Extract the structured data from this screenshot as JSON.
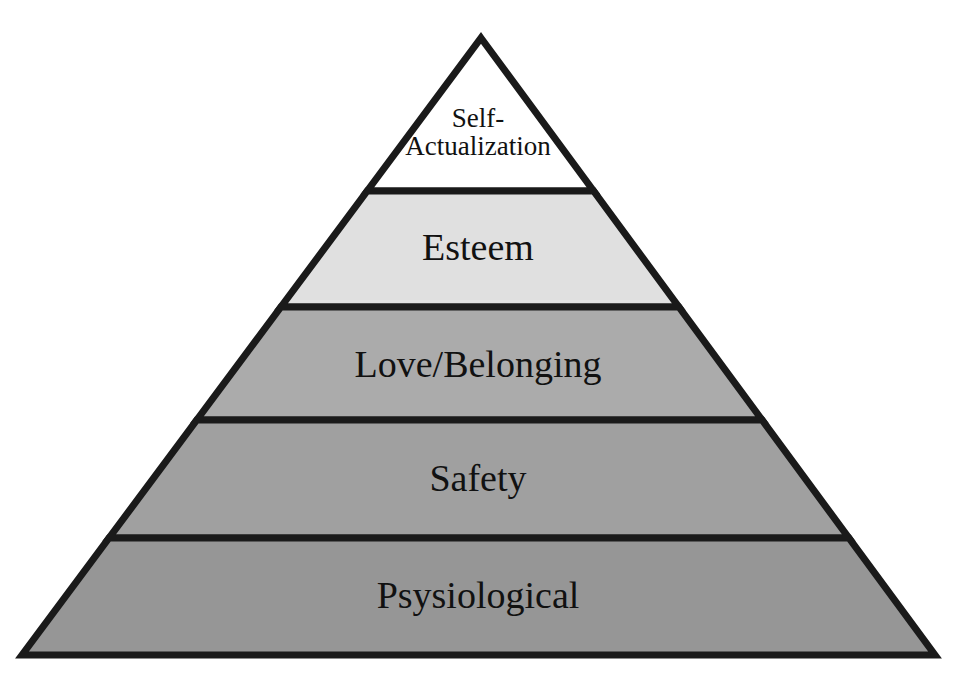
{
  "figure": {
    "name": "maslows-hierarchy-of-needs-pyramid",
    "shape": "pyramid",
    "background_color": "#ffffff",
    "outline_color": "#1a1a1a",
    "outline_width_px": 7,
    "apex": {
      "x": 481,
      "y": 38
    },
    "base_left": {
      "x": 22,
      "y": 655
    },
    "base_right": {
      "x": 935,
      "y": 655
    },
    "divider_y": [
      191,
      307,
      420,
      538
    ]
  },
  "chart_data": {
    "type": "pyramid",
    "title": "",
    "tiers": [
      {
        "label": "Self-\nActualization",
        "label_plain": "Self-Actualization",
        "rank": 5,
        "fill": "#ffffff",
        "top_y": 38,
        "bottom_y": 191,
        "font_size_class": "size-small"
      },
      {
        "label": "Esteem",
        "label_plain": "Esteem",
        "rank": 4,
        "fill": "#e0e0e0",
        "top_y": 191,
        "bottom_y": 307,
        "font_size_class": "size-large"
      },
      {
        "label": "Love/Belonging",
        "label_plain": "Love/Belonging",
        "rank": 3,
        "fill": "#ababab",
        "top_y": 307,
        "bottom_y": 420,
        "font_size_class": "size-large"
      },
      {
        "label": "Safety",
        "label_plain": "Safety",
        "rank": 2,
        "fill": "#a0a0a0",
        "top_y": 420,
        "bottom_y": 538,
        "font_size_class": "size-large"
      },
      {
        "label": "Psysiological",
        "label_plain": "Psysiological",
        "rank": 1,
        "fill": "#969696",
        "top_y": 538,
        "bottom_y": 655,
        "font_size_class": "size-large"
      }
    ]
  }
}
